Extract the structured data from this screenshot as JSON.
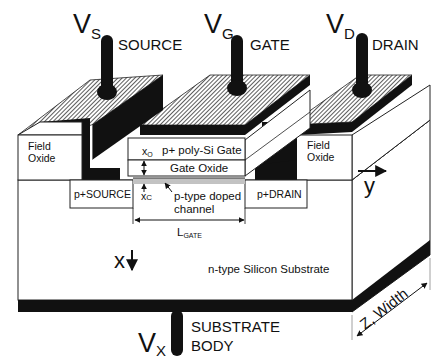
{
  "diagram": {
    "type": "mosfet-cross-section",
    "terminals": [
      {
        "id": "source",
        "symbol": "V",
        "subscript": "S",
        "label": "SOURCE"
      },
      {
        "id": "gate",
        "symbol": "V",
        "subscript": "G",
        "label": "GATE"
      },
      {
        "id": "drain",
        "symbol": "V",
        "subscript": "D",
        "label": "DRAIN"
      },
      {
        "id": "body",
        "symbol": "V",
        "subscript": "X",
        "label_line1": "SUBSTRATE",
        "label_line2": "BODY"
      }
    ],
    "regions": {
      "field_oxide_left": {
        "line1": "Field",
        "line2": "Oxide"
      },
      "field_oxide_right": {
        "line1": "Field",
        "line2": "Oxide"
      },
      "poly_gate": "p+ poly-Si Gate",
      "gate_oxide": "Gate Oxide",
      "source": "p+SOURCE",
      "drain": "p+DRAIN",
      "channel": {
        "line1": "p-type doped",
        "line2": "channel"
      },
      "substrate": "n-type Silicon Substrate"
    },
    "dimensions": {
      "oxide_thickness": {
        "symbol": "x",
        "subscript": "O"
      },
      "channel_depth": {
        "symbol": "x",
        "subscript": "C"
      },
      "gate_length": {
        "symbol": "L",
        "subscript": "GATE"
      },
      "width": "Z, Width"
    },
    "axes": {
      "x": "x",
      "y": "y"
    },
    "colors": {
      "metal": "#111111",
      "hatch": "#555555",
      "background": "#ffffff",
      "outline": "#222222"
    }
  }
}
